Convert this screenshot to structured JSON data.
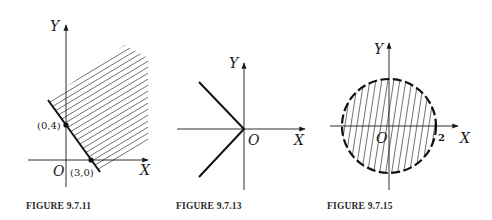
{
  "figures": [
    {
      "caption": "FIGURE 9.7.11",
      "axes": {
        "x_label": "X",
        "y_label": "Y",
        "origin_label": "O"
      },
      "points": [
        {
          "label": "(0,4)"
        },
        {
          "label": "(3,0)"
        }
      ],
      "description": "Half-plane 4x + 3y ≥ 12 shaded, boundary line solid through (0,4) and (3,0)"
    },
    {
      "caption": "FIGURE 9.7.13",
      "axes": {
        "x_label": "X",
        "y_label": "Y",
        "origin_label": "O"
      },
      "description": "Graph of x = -|y| : two rays from origin into second and third quadrants"
    },
    {
      "caption": "FIGURE 9.7.15",
      "axes": {
        "x_label": "X",
        "y_label": "Y",
        "origin_label": "O"
      },
      "tick_label": "2",
      "description": "Open disk of radius 2 centered at origin, dashed boundary, interior hatched"
    }
  ]
}
